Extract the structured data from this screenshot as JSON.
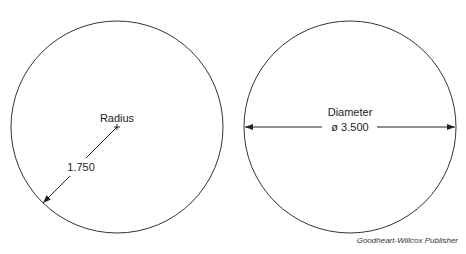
{
  "diagram": {
    "radius_circle": {
      "label": "Radius",
      "value": "1.750",
      "center": [
        117,
        127
      ],
      "r": 106
    },
    "diameter_circle": {
      "label": "Diameter",
      "value": "ø 3.500",
      "center": [
        350,
        127
      ],
      "r": 106
    },
    "credit": "Goodheart-Willcox Publisher",
    "stroke_color": "#333333"
  }
}
